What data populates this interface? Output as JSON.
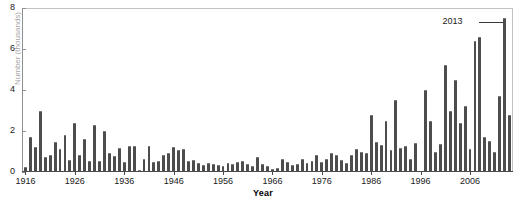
{
  "chart_data": {
    "type": "bar",
    "title": "",
    "subtitle": "",
    "xlabel": "Year",
    "ylabel": "Number (thousands)",
    "ylabel_truncated": true,
    "xlim": [
      1915.5,
      2014.5
    ],
    "ylim": [
      0,
      8
    ],
    "yticks": [
      0,
      2,
      4,
      6,
      8
    ],
    "ytick_labels": [
      "0",
      "2",
      "4",
      "6",
      "8"
    ],
    "xticks": [
      1916,
      1926,
      1936,
      1946,
      1956,
      1966,
      1976,
      1986,
      1996,
      2006
    ],
    "xtick_labels": [
      "1916",
      "1926",
      "1936",
      "1946",
      "1956",
      "1966",
      "1976",
      "1986",
      "1996",
      "2006"
    ],
    "grid": false,
    "legend": null,
    "bar_color": "#4d4d4d",
    "annotations": [
      {
        "label": "2013",
        "points_to_year": 2013,
        "points_to_value": 7.5
      }
    ],
    "categories": [
      1916,
      1917,
      1918,
      1919,
      1920,
      1921,
      1922,
      1923,
      1924,
      1925,
      1926,
      1927,
      1928,
      1929,
      1930,
      1931,
      1932,
      1933,
      1934,
      1935,
      1936,
      1937,
      1938,
      1939,
      1940,
      1941,
      1942,
      1943,
      1944,
      1945,
      1946,
      1947,
      1948,
      1949,
      1950,
      1951,
      1952,
      1953,
      1954,
      1955,
      1956,
      1957,
      1958,
      1959,
      1960,
      1961,
      1962,
      1963,
      1964,
      1965,
      1966,
      1967,
      1968,
      1969,
      1970,
      1971,
      1972,
      1973,
      1974,
      1975,
      1976,
      1977,
      1978,
      1979,
      1980,
      1981,
      1982,
      1983,
      1984,
      1985,
      1986,
      1987,
      1988,
      1989,
      1990,
      1991,
      1992,
      1993,
      1994,
      1995,
      1996,
      1997,
      1998,
      1999,
      2000,
      2001,
      2002,
      2003,
      2004,
      2005,
      2006,
      2007,
      2008,
      2009,
      2010,
      2011,
      2012,
      2013,
      2014
    ],
    "values": [
      0.25,
      1.7,
      1.2,
      3.0,
      0.75,
      0.85,
      1.45,
      1.1,
      1.8,
      0.6,
      2.4,
      0.85,
      1.6,
      0.55,
      2.3,
      0.55,
      2.0,
      0.95,
      0.8,
      1.15,
      0.5,
      1.25,
      1.25,
      0.1,
      0.65,
      1.25,
      0.5,
      0.55,
      0.85,
      0.95,
      1.2,
      1.05,
      1.1,
      0.55,
      0.6,
      0.45,
      0.35,
      0.45,
      0.4,
      0.35,
      0.3,
      0.45,
      0.4,
      0.5,
      0.55,
      0.4,
      0.3,
      0.75,
      0.4,
      0.3,
      0.15,
      0.2,
      0.65,
      0.5,
      0.35,
      0.4,
      0.65,
      0.45,
      0.55,
      0.85,
      0.5,
      0.65,
      0.95,
      0.85,
      0.6,
      0.45,
      0.85,
      1.1,
      1.0,
      0.95,
      2.8,
      1.45,
      1.3,
      2.5,
      1.05,
      3.5,
      1.15,
      1.25,
      0.65,
      1.4,
      0.05,
      4.0,
      2.5,
      1.0,
      1.35,
      5.2,
      3.0,
      4.5,
      2.4,
      3.2,
      1.1,
      6.4,
      6.6,
      1.7,
      1.5,
      1.0,
      3.7,
      7.5,
      2.8
    ]
  }
}
